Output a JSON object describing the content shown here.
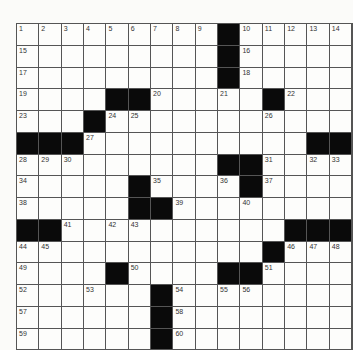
{
  "puzzle": {
    "rows": 15,
    "cols": 15,
    "grid": [
      [
        "1",
        "2",
        "3",
        "4",
        "5",
        "6",
        "7",
        "8",
        "9",
        "#",
        "10",
        "11",
        "12",
        "13",
        "14"
      ],
      [
        "15",
        "",
        "",
        "",
        "",
        "",
        "",
        "",
        "",
        "#",
        "16",
        "",
        "",
        "",
        ""
      ],
      [
        "17",
        "",
        "",
        "",
        "",
        "",
        "",
        "",
        "",
        "#",
        "18",
        "",
        "",
        "",
        ""
      ],
      [
        "19",
        "",
        "",
        "",
        "#",
        "#",
        "20",
        "",
        "",
        "21",
        "",
        "#",
        "22",
        "",
        ""
      ],
      [
        "23",
        "",
        "",
        "#",
        "24",
        "25",
        "",
        "",
        "",
        "",
        "",
        "26",
        "",
        "",
        ""
      ],
      [
        "#",
        "#",
        "#",
        "27",
        "",
        "",
        "",
        "",
        "",
        "",
        "",
        "",
        "",
        "#",
        "#"
      ],
      [
        "28",
        "29",
        "30",
        "",
        "",
        "",
        "",
        "",
        "",
        "#",
        "#",
        "31",
        "",
        "32",
        "33"
      ],
      [
        "34",
        "",
        "",
        "",
        "",
        "#",
        "35",
        "",
        "",
        "36",
        "#",
        "37",
        "",
        "",
        ""
      ],
      [
        "38",
        "",
        "",
        "",
        "",
        "#",
        "#",
        "39",
        "",
        "",
        "40",
        "",
        "",
        "",
        ""
      ],
      [
        "#",
        "#",
        "41",
        "",
        "42",
        "43",
        "",
        "",
        "",
        "",
        "",
        "",
        "#",
        "#",
        "#"
      ],
      [
        "44",
        "45",
        "",
        "",
        "",
        "",
        "",
        "",
        "",
        "",
        "",
        "#",
        "46",
        "47",
        "48"
      ],
      [
        "49",
        "",
        "",
        "",
        "#",
        "50",
        "",
        "",
        "",
        "#",
        "#",
        "51",
        "",
        "",
        ""
      ],
      [
        "52",
        "",
        "",
        "53",
        "",
        "",
        "#",
        "54",
        "",
        "55",
        "56",
        "",
        "",
        "",
        ""
      ],
      [
        "57",
        "",
        "",
        "",
        "",
        "",
        "#",
        "58",
        "",
        "",
        "",
        "",
        "",
        "",
        ""
      ],
      [
        "59",
        "",
        "",
        "",
        "",
        "",
        "#",
        "60",
        "",
        "",
        "",
        "",
        "",
        "",
        ""
      ]
    ]
  }
}
